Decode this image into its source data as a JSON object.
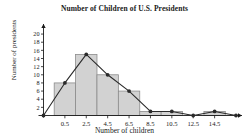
{
  "chart_data": {
    "type": "bar",
    "title": "Number of Children of U.S. Presidents",
    "xlabel": "Number of children",
    "ylabel": "Number of presidents",
    "categories": [
      "0.5",
      "2.5",
      "4.5",
      "6.5",
      "8.5",
      "10.5",
      "12.5",
      "14.5"
    ],
    "x": [
      0.5,
      2.5,
      4.5,
      6.5,
      8.5,
      10.5,
      12.5,
      14.5
    ],
    "values": [
      8,
      15,
      10,
      6,
      1,
      1,
      0,
      1
    ],
    "bin_width": 2,
    "xlim": [
      -1.5,
      16.5
    ],
    "ylim": [
      0,
      21
    ],
    "ytick_labels": [
      "2",
      "4",
      "6",
      "8",
      "10",
      "12",
      "14",
      "16",
      "18",
      "20"
    ],
    "ytick_values": [
      2,
      4,
      6,
      8,
      10,
      12,
      14,
      16,
      18,
      20
    ],
    "xtick_labels": [
      "0.5",
      "2.5",
      "4.5",
      "6.5",
      "8.5",
      "10.5",
      "12.5",
      "14.5"
    ],
    "xtick_values": [
      0.5,
      2.5,
      4.5,
      6.5,
      8.5,
      10.5,
      12.5,
      14.5
    ],
    "grid": false,
    "legend": "none",
    "overlay": {
      "type": "line",
      "name": "frequency polygon",
      "x": [
        -1.5,
        0.5,
        2.5,
        4.5,
        6.5,
        8.5,
        10.5,
        12.5,
        14.5,
        16.5
      ],
      "values": [
        0,
        8,
        15,
        10,
        6,
        1,
        1,
        0,
        1,
        0
      ],
      "marker": "filled-circle"
    },
    "colors": {
      "bar_fill": "#d2d2d2",
      "bar_stroke": "#8c8c8c",
      "line": "#2b2b2b",
      "axis": "#1a1a1a",
      "text": "#1a1a1a"
    }
  }
}
